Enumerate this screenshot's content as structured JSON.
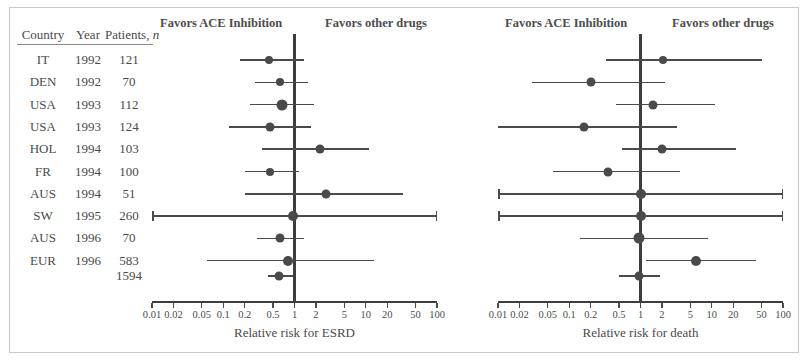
{
  "figure": {
    "panel_headers": {
      "favors_left": "Favors ACE Inhibition",
      "favors_right": "Favors other drugs"
    }
  },
  "table": {
    "headers": {
      "country": "Country",
      "year": "Year",
      "patients": "Patients, ",
      "patients_italic": "n"
    },
    "rows": [
      {
        "country": "IT",
        "year": "1992",
        "patients": "121"
      },
      {
        "country": "DEN",
        "year": "1992",
        "patients": "70"
      },
      {
        "country": "USA",
        "year": "1993",
        "patients": "112"
      },
      {
        "country": "USA",
        "year": "1993",
        "patients": "124"
      },
      {
        "country": "HOL",
        "year": "1994",
        "patients": "103"
      },
      {
        "country": "FR",
        "year": "1994",
        "patients": "100"
      },
      {
        "country": "AUS",
        "year": "1994",
        "patients": "51"
      },
      {
        "country": "SW",
        "year": "1995",
        "patients": "260"
      },
      {
        "country": "AUS",
        "year": "1996",
        "patients": "70"
      },
      {
        "country": "EUR",
        "year": "1996",
        "patients": "583"
      }
    ],
    "total": {
      "country": "",
      "year": "",
      "patients": "1594"
    }
  },
  "chart_data": [
    {
      "type": "scatter",
      "name": "esrd",
      "title": "Relative risk for ESRD",
      "xlabel": "Relative risk for ESRD",
      "ylabel": "",
      "scale": "log",
      "xlim": [
        0.01,
        100
      ],
      "reference_line": 1,
      "grid": false,
      "legend": [],
      "ticks": [
        "0.01",
        "0.02",
        "0.05",
        "0.1",
        "0.2",
        "0.5",
        "1",
        "2",
        "5",
        "10",
        "20",
        "50",
        "100"
      ],
      "tick_values": [
        0.01,
        0.02,
        0.05,
        0.1,
        0.2,
        0.5,
        1,
        2,
        5,
        10,
        20,
        50,
        100
      ],
      "annotations": [
        "Favors ACE Inhibition",
        "Favors other drugs"
      ],
      "points": [
        {
          "label": "IT 1992",
          "rr": 0.44,
          "lo": 0.17,
          "hi": 1.35,
          "size": 8,
          "lo_arrow": false,
          "hi_arrow": false
        },
        {
          "label": "DEN 1992",
          "rr": 0.62,
          "lo": 0.28,
          "hi": 1.55,
          "size": 8,
          "lo_arrow": false,
          "hi_arrow": false
        },
        {
          "label": "USA 1993",
          "rr": 0.66,
          "lo": 0.24,
          "hi": 1.9,
          "size": 11,
          "lo_arrow": false,
          "hi_arrow": false
        },
        {
          "label": "USA 1993",
          "rr": 0.46,
          "lo": 0.12,
          "hi": 1.7,
          "size": 9,
          "lo_arrow": false,
          "hi_arrow": false
        },
        {
          "label": "HOL 1994",
          "rr": 2.3,
          "lo": 0.35,
          "hi": 11.0,
          "size": 9,
          "lo_arrow": false,
          "hi_arrow": false
        },
        {
          "label": "FR 1994",
          "rr": 0.45,
          "lo": 0.2,
          "hi": 1.15,
          "size": 8,
          "lo_arrow": false,
          "hi_arrow": false
        },
        {
          "label": "AUS 1994",
          "rr": 2.8,
          "lo": 0.2,
          "hi": 33.0,
          "size": 9,
          "lo_arrow": false,
          "hi_arrow": false
        },
        {
          "label": "SW 1995",
          "rr": 0.95,
          "lo": 0.01,
          "hi": 100,
          "size": 10,
          "lo_arrow": true,
          "hi_arrow": true
        },
        {
          "label": "AUS 1996",
          "rr": 0.62,
          "lo": 0.3,
          "hi": 1.35,
          "size": 9,
          "lo_arrow": false,
          "hi_arrow": false
        },
        {
          "label": "EUR 1996",
          "rr": 0.8,
          "lo": 0.06,
          "hi": 13.0,
          "size": 10,
          "lo_arrow": false,
          "hi_arrow": false
        },
        {
          "label": "Pooled",
          "rr": 0.6,
          "lo": 0.42,
          "hi": 0.95,
          "size": 9,
          "lo_arrow": false,
          "hi_arrow": false
        }
      ]
    },
    {
      "type": "scatter",
      "name": "death",
      "title": "Relative risk for death",
      "xlabel": "Relative risk for death",
      "ylabel": "",
      "scale": "log",
      "xlim": [
        0.01,
        100
      ],
      "reference_line": 1,
      "grid": false,
      "legend": [],
      "ticks": [
        "0.01",
        "0.02",
        "0.05",
        "0.1",
        "0.2",
        "0.5",
        "1",
        "2",
        "5",
        "10",
        "20",
        "50",
        "100"
      ],
      "tick_values": [
        0.01,
        0.02,
        0.05,
        0.1,
        0.2,
        0.5,
        1,
        2,
        5,
        10,
        20,
        50,
        100
      ],
      "annotations": [
        "Favors ACE Inhibition",
        "Favors other drugs"
      ],
      "points": [
        {
          "label": "IT 1992",
          "rr": 2.1,
          "lo": 0.33,
          "hi": 50.0,
          "size": 8,
          "lo_arrow": false,
          "hi_arrow": false
        },
        {
          "label": "DEN 1992",
          "rr": 0.2,
          "lo": 0.03,
          "hi": 2.2,
          "size": 9,
          "lo_arrow": false,
          "hi_arrow": false
        },
        {
          "label": "USA 1993",
          "rr": 1.5,
          "lo": 0.45,
          "hi": 11.0,
          "size": 9,
          "lo_arrow": false,
          "hi_arrow": false
        },
        {
          "label": "USA 1993",
          "rr": 0.16,
          "lo": 0.01,
          "hi": 3.3,
          "size": 9,
          "lo_arrow": false,
          "hi_arrow": false
        },
        {
          "label": "HOL 1994",
          "rr": 2.0,
          "lo": 0.55,
          "hi": 22.0,
          "size": 9,
          "lo_arrow": false,
          "hi_arrow": false
        },
        {
          "label": "FR 1994",
          "rr": 0.35,
          "lo": 0.06,
          "hi": 3.6,
          "size": 9,
          "lo_arrow": false,
          "hi_arrow": false
        },
        {
          "label": "AUS 1994",
          "rr": 1.0,
          "lo": 0.01,
          "hi": 100,
          "size": 10,
          "lo_arrow": true,
          "hi_arrow": true
        },
        {
          "label": "SW 1995",
          "rr": 1.0,
          "lo": 0.01,
          "hi": 100,
          "size": 10,
          "lo_arrow": true,
          "hi_arrow": true
        },
        {
          "label": "AUS 1996",
          "rr": 0.95,
          "lo": 0.14,
          "hi": 9.0,
          "size": 11,
          "lo_arrow": false,
          "hi_arrow": false
        },
        {
          "label": "EUR 1996",
          "rr": 6.0,
          "lo": 1.2,
          "hi": 42.0,
          "size": 10,
          "lo_arrow": false,
          "hi_arrow": false
        },
        {
          "label": "Pooled",
          "rr": 0.95,
          "lo": 0.5,
          "hi": 1.9,
          "size": 9,
          "lo_arrow": false,
          "hi_arrow": false
        }
      ]
    }
  ]
}
